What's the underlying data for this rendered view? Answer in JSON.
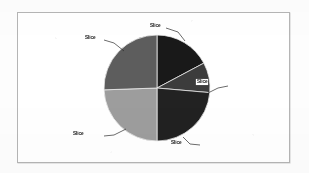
{
  "chart_data": {
    "type": "pie",
    "title": "",
    "subtitle": "",
    "xlabel": "",
    "ylabel": "",
    "grid": false,
    "legend": false,
    "legend_position": "none",
    "labels_shown": true,
    "label_style": "callout-with-leader-line",
    "categories": [
      "Slice",
      "Slice",
      "Slice",
      "Slice",
      "Slice"
    ],
    "values": [
      17.2,
      9.2,
      23.6,
      24.4,
      25.6
    ],
    "units": "percent",
    "start_angle_deg": 0,
    "direction": "clockwise",
    "slices": [
      {
        "label": "Slice",
        "value": 17.2,
        "start_angle_deg": 0,
        "end_angle_deg": 62,
        "color": "#1b1b1b"
      },
      {
        "label": "Slice",
        "value": 9.2,
        "start_angle_deg": 62,
        "end_angle_deg": 95,
        "color": "#3d3d3d"
      },
      {
        "label": "Slice",
        "value": 23.6,
        "start_angle_deg": 95,
        "end_angle_deg": 180,
        "color": "#242424"
      },
      {
        "label": "Slice",
        "value": 24.4,
        "start_angle_deg": 180,
        "end_angle_deg": 268,
        "color": "#9c9c9c"
      },
      {
        "label": "Slice",
        "value": 25.6,
        "start_angle_deg": 268,
        "end_angle_deg": 360,
        "color": "#5e5e5e"
      }
    ],
    "geometry": {
      "center_x": 139,
      "center_y": 75,
      "radius": 53
    }
  },
  "chart": {
    "frame_border_color": "#b4b4b4",
    "background_color": "#ffffff",
    "label_text_color": "#111111"
  },
  "labels": {
    "slice_1": "Slice",
    "slice_2": "Slice",
    "slice_3": "Slice",
    "slice_4": "Slice",
    "slice_5": "Slice"
  }
}
